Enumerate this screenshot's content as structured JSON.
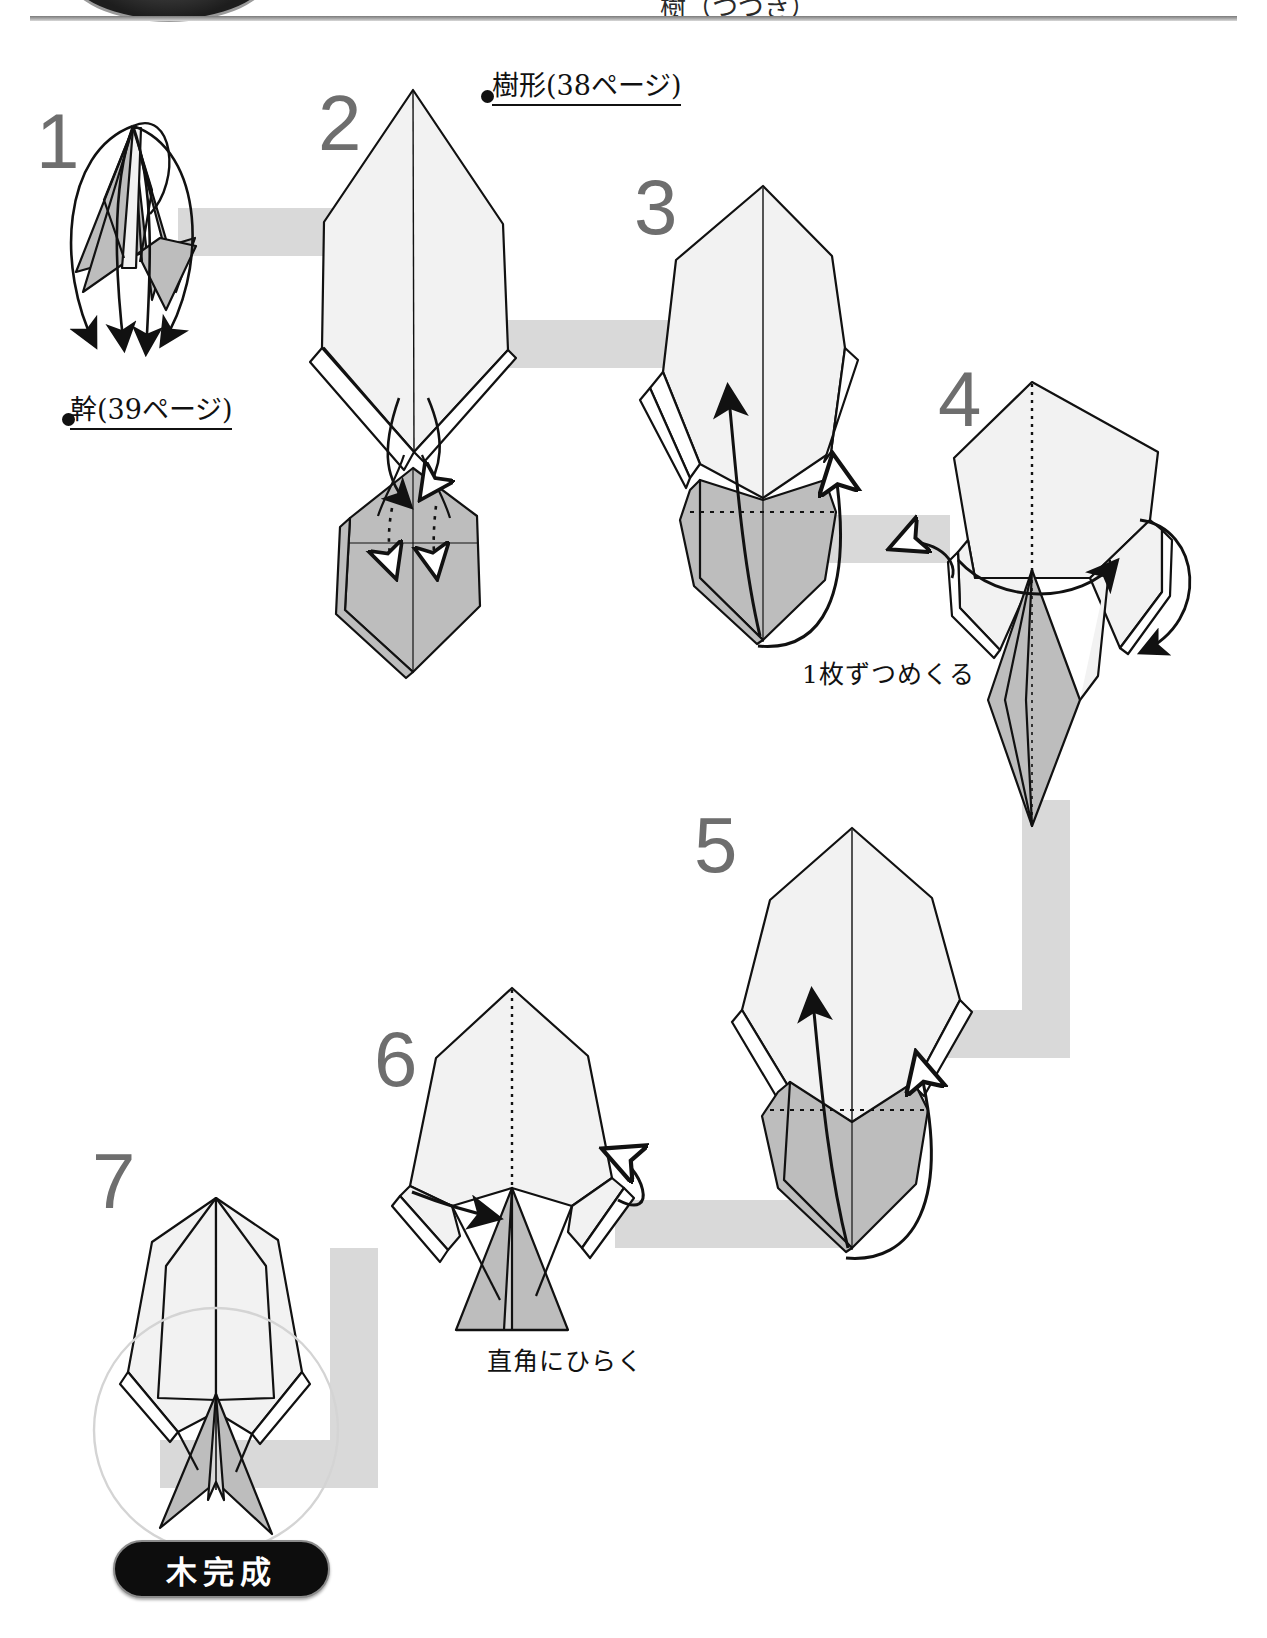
{
  "page": {
    "title_cut_off": "樹（つづき）",
    "background": "#ffffff",
    "rule_color": "#8a8a8a",
    "flow_band_color": "#d9d9d9",
    "paper_front_color": "#f2f2f2",
    "paper_back_color": "#bdbdbd",
    "line_color": "#1a1a1a",
    "step_number_color": "#6e6e6e"
  },
  "references": [
    {
      "name": "tree-shape-ref",
      "text": "樹形(38ページ)",
      "page": 38
    },
    {
      "name": "trunk-ref",
      "text": "幹(39ページ)",
      "page": 39
    }
  ],
  "steps": [
    {
      "number": "1",
      "note": ""
    },
    {
      "number": "2",
      "note": ""
    },
    {
      "number": "3",
      "note": ""
    },
    {
      "number": "4",
      "note": "1枚ずつめくる"
    },
    {
      "number": "5",
      "note": ""
    },
    {
      "number": "6",
      "note": "直角にひらく"
    },
    {
      "number": "7",
      "note": ""
    }
  ],
  "annotations": [
    {
      "name": "peel-one-sheet-note",
      "text": "1枚ずつめくる"
    },
    {
      "name": "open-right-angle-note",
      "text": "直角にひらく"
    }
  ],
  "completion_badge": {
    "text": "木完成"
  },
  "flow_order": [
    "1",
    "2",
    "3",
    "4",
    "5",
    "6",
    "7"
  ]
}
